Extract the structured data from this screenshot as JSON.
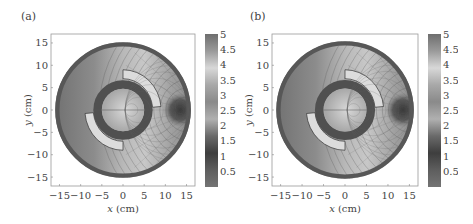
{
  "figure": {
    "panels": [
      {
        "label": "(a)",
        "offset_x": 0
      },
      {
        "label": "(b)",
        "offset_x": 222
      }
    ]
  },
  "chart_data": [
    {
      "type": "heatmap",
      "panel": "(a)",
      "title": "",
      "xlabel": "x (cm)",
      "ylabel": "y (cm)",
      "xlim": [
        -17,
        17
      ],
      "ylim": [
        -17,
        17
      ],
      "xticks": [
        -15,
        -10,
        -5,
        0,
        5,
        10,
        15
      ],
      "yticks": [
        15,
        10,
        5,
        0,
        -5,
        -10,
        -15
      ],
      "colorbar": {
        "ticks": [
          5,
          4.5,
          4,
          3.5,
          3,
          2.5,
          2,
          1.5,
          1,
          0.5
        ],
        "range": [
          0,
          5
        ],
        "colors": [
          "#6e6e6e",
          "#9a9a9a",
          "#d8d8d8",
          "#a8a8a8",
          "#8a8a8a",
          "#b0b0b0",
          "#6a6a6a",
          "#3e3e3e",
          "#5e5e5e",
          "#747474"
        ]
      },
      "geometry": {
        "outer_radius_cm": 16,
        "outer_ring_width_cm": 1,
        "inner_ring_outer_radius_cm": 7,
        "inner_ring_inner_radius_cm": 5,
        "arc_shield_inner_radius_cm": 7,
        "arc_shield_outer_radius_cm": 9,
        "hot_spot_center_cm": [
          13.5,
          0
        ],
        "hot_spot_radius_cm": 2.5
      },
      "grid": false
    },
    {
      "type": "heatmap",
      "panel": "(b)",
      "title": "",
      "xlabel": "x (cm)",
      "ylabel": "y (cm)",
      "xlim": [
        -17,
        17
      ],
      "ylim": [
        -17,
        17
      ],
      "xticks": [
        -15,
        -10,
        -5,
        0,
        5,
        10,
        15
      ],
      "yticks": [
        15,
        10,
        5,
        0,
        -5,
        -10,
        -15
      ],
      "colorbar": {
        "ticks": [
          5,
          4.5,
          4,
          3.5,
          3,
          2.5,
          2,
          1.5,
          1,
          0.5
        ],
        "range": [
          0,
          5
        ],
        "colors": [
          "#6e6e6e",
          "#9a9a9a",
          "#d8d8d8",
          "#a8a8a8",
          "#8a8a8a",
          "#b0b0b0",
          "#6a6a6a",
          "#3e3e3e",
          "#5e5e5e",
          "#747474"
        ]
      },
      "geometry": {
        "outer_radius_cm": 16,
        "outer_ring_width_cm": 1,
        "inner_ring_outer_radius_cm": 7,
        "inner_ring_inner_radius_cm": 5,
        "arc_shield_inner_radius_cm": 7,
        "arc_shield_outer_radius_cm": 9,
        "hot_spot_center_cm": [
          13.5,
          0
        ],
        "hot_spot_radius_cm": 2.5
      },
      "grid": false
    }
  ]
}
